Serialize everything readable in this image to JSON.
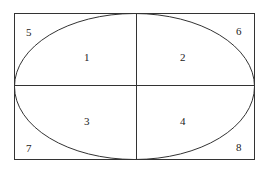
{
  "diagram": {
    "regions": [
      {
        "id": "1",
        "label": "1",
        "position": "ellipse upper-left"
      },
      {
        "id": "2",
        "label": "2",
        "position": "ellipse upper-right"
      },
      {
        "id": "3",
        "label": "3",
        "position": "ellipse lower-left"
      },
      {
        "id": "4",
        "label": "4",
        "position": "ellipse lower-right"
      },
      {
        "id": "5",
        "label": "5",
        "position": "corner top-left"
      },
      {
        "id": "6",
        "label": "6",
        "position": "corner top-right"
      },
      {
        "id": "7",
        "label": "7",
        "position": "corner bottom-left"
      },
      {
        "id": "8",
        "label": "8",
        "position": "corner bottom-right"
      }
    ],
    "stroke_color": "#333333"
  }
}
